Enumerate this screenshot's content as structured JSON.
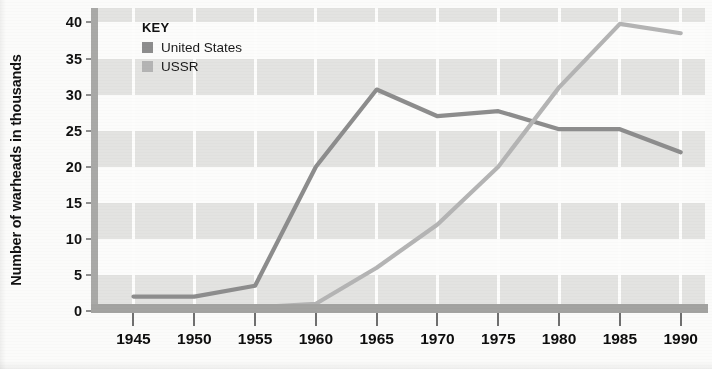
{
  "chart_data": {
    "type": "line",
    "title": "",
    "subtitle": "",
    "xlabel": "",
    "ylabel": "Number of warheads in thousands",
    "x": [
      1945,
      1950,
      1955,
      1960,
      1965,
      1970,
      1975,
      1980,
      1985,
      1990
    ],
    "xlim": [
      1942,
      1992
    ],
    "ylim": [
      0,
      42
    ],
    "yticks": [
      0,
      5,
      10,
      15,
      20,
      25,
      30,
      35,
      40
    ],
    "xticks": [
      1945,
      1950,
      1955,
      1960,
      1965,
      1970,
      1975,
      1980,
      1985,
      1990
    ],
    "xtick_labels": [
      "1945",
      "1950",
      "1955",
      "1960",
      "1965",
      "1970",
      "1975",
      "1980",
      "1985",
      "1990"
    ],
    "ytick_labels": [
      "0",
      "5",
      "10",
      "15",
      "20",
      "25",
      "30",
      "35",
      "40"
    ],
    "grid": "horizontal-bands-and-vertical-lines",
    "legend_position": "top-left-inside",
    "series": [
      {
        "name": "United States",
        "color": "#8d8d8d",
        "values": [
          2,
          2,
          3.5,
          20,
          30.7,
          27,
          27.7,
          25.2,
          25.2,
          22
        ]
      },
      {
        "name": "USSR",
        "color": "#b4b4b4",
        "values": [
          0.2,
          0.3,
          0.5,
          1,
          6,
          12,
          20,
          31,
          39.8,
          38.5
        ]
      }
    ]
  },
  "legend": {
    "title": "KEY",
    "entries": [
      {
        "label": "United States",
        "color": "#8d8d8d"
      },
      {
        "label": "USSR",
        "color": "#b4b4b4"
      }
    ]
  },
  "axes": {
    "y_title": "Number of warheads in thousands"
  }
}
